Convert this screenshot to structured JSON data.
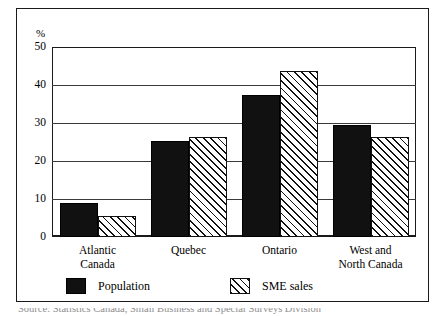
{
  "figure": {
    "unit_label": "%",
    "caption_partial": "Source: Statistics Canada, Small Business and Special Surveys Division"
  },
  "legend": {
    "position": "bottom",
    "entries": [
      {
        "label": "Population",
        "swatch": "solid-black-swatch"
      },
      {
        "label": "SME sales",
        "swatch": "hatched-swatch"
      }
    ]
  },
  "axis": {
    "y_ticks": [
      "0",
      "10",
      "20",
      "30",
      "40",
      "50"
    ],
    "y_unit": "%"
  },
  "chart_data": {
    "type": "bar",
    "title": "",
    "subtitle": "",
    "xlabel": "",
    "ylabel": "%",
    "ylim": [
      0,
      50
    ],
    "yticks": [
      0,
      10,
      20,
      30,
      40,
      50
    ],
    "grid": true,
    "legend_position": "bottom",
    "categories": [
      "Atlantic Canada",
      "Quebec",
      "Ontario",
      "West and North Canada"
    ],
    "category_lines": [
      [
        "Atlantic",
        "Canada"
      ],
      [
        "Quebec"
      ],
      [
        "Ontario"
      ],
      [
        "West and",
        "North Canada"
      ]
    ],
    "series": [
      {
        "name": "Population",
        "values": [
          9.0,
          25.3,
          37.4,
          29.5
        ]
      },
      {
        "name": "SME sales",
        "values": [
          5.4,
          26.2,
          43.7,
          26.3
        ]
      }
    ],
    "colors": {
      "Population": "#111111",
      "SME sales": "#ffffff"
    }
  }
}
